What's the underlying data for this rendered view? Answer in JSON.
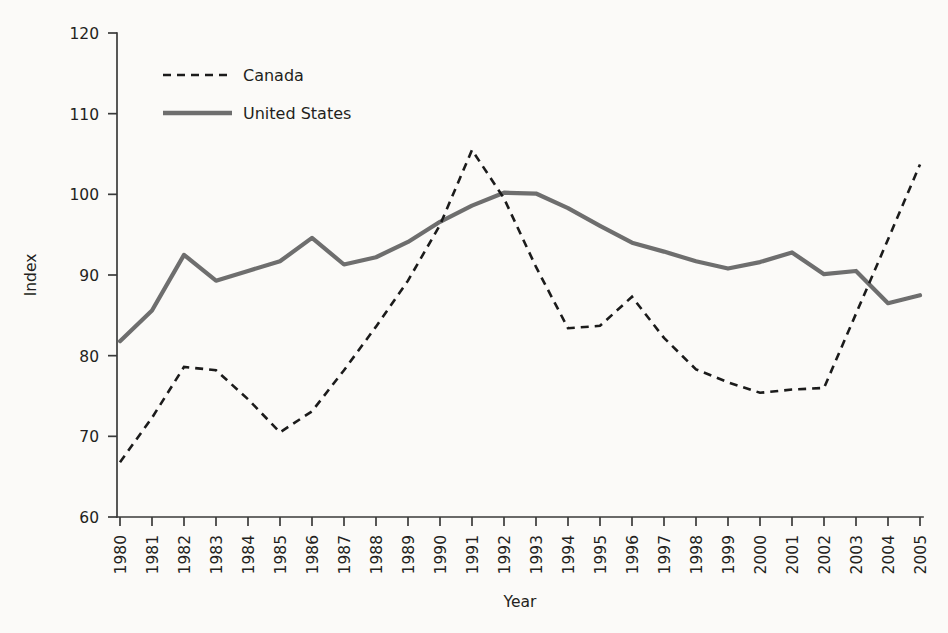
{
  "chart_data": {
    "type": "line",
    "title": "",
    "xlabel": "Year",
    "ylabel": "Index",
    "xlim": [
      1980,
      2005
    ],
    "ylim": [
      60,
      120
    ],
    "ytick_values": [
      60,
      70,
      80,
      90,
      100,
      110,
      120
    ],
    "grid": false,
    "legend_position": "top-left",
    "x": [
      1980,
      1981,
      1982,
      1983,
      1984,
      1985,
      1986,
      1987,
      1988,
      1989,
      1990,
      1991,
      1992,
      1993,
      1994,
      1995,
      1996,
      1997,
      1998,
      1999,
      2000,
      2001,
      2002,
      2003,
      2004,
      2005
    ],
    "categories": [
      "1980",
      "1981",
      "1982",
      "1983",
      "1984",
      "1985",
      "1986",
      "1987",
      "1988",
      "1989",
      "1990",
      "1991",
      "1992",
      "1993",
      "1994",
      "1995",
      "1996",
      "1997",
      "1998",
      "1999",
      "2000",
      "2001",
      "2002",
      "2003",
      "2004",
      "2005"
    ],
    "series": [
      {
        "name": "Canada",
        "style": "dashed",
        "color": "#1b1b1b",
        "values": [
          66.8,
          72.3,
          78.6,
          78.2,
          74.6,
          70.5,
          73.1,
          78.2,
          83.6,
          89.3,
          96.2,
          105.5,
          99.5,
          91.0,
          83.4,
          83.7,
          87.3,
          82.2,
          78.3,
          76.7,
          75.4,
          75.8,
          76.0,
          85.2,
          94.4,
          103.7
        ]
      },
      {
        "name": "United States",
        "style": "solid",
        "color": "#6e6e6e",
        "values": [
          81.8,
          85.6,
          92.5,
          89.3,
          90.5,
          91.7,
          94.6,
          91.3,
          92.2,
          94.1,
          96.6,
          98.6,
          100.2,
          100.1,
          98.3,
          96.1,
          94.0,
          92.9,
          91.7,
          90.8,
          91.6,
          92.8,
          90.1,
          90.5,
          86.5,
          87.5
        ]
      }
    ]
  },
  "legend": {
    "items": [
      {
        "label": "Canada"
      },
      {
        "label": "United States"
      }
    ]
  },
  "colors": {
    "canada": "#1b1b1b",
    "united_states": "#6e6e6e",
    "axis": "#3a3a3a",
    "text": "#231f20",
    "background": "#fbfaf8"
  }
}
